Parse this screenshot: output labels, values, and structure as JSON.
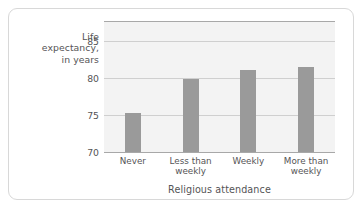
{
  "chart_data": {
    "type": "bar",
    "title": "",
    "xlabel": "Religious attendance",
    "ylabel": "Life expectancy, in years",
    "ylabel_lines": [
      "Life",
      "expectancy,",
      "in years"
    ],
    "categories": [
      "Never",
      "Less than weekly",
      "Weekly",
      "More than weekly"
    ],
    "category_lines": [
      [
        "Never"
      ],
      [
        "Less than",
        "weekly"
      ],
      [
        "Weekly"
      ],
      [
        "More than",
        "weekly"
      ]
    ],
    "values": [
      75.3,
      79.8,
      81.0,
      81.5
    ],
    "ylim": [
      70,
      87.5
    ],
    "yticks": [
      70,
      75,
      80,
      85
    ],
    "ytick_labels": [
      "70",
      "75",
      "80",
      "85"
    ],
    "grid": true,
    "legend": false,
    "colors": {
      "bar": "#9a9a9a",
      "plot_background": "#f3f3f3",
      "gridline": "#cfcfcf",
      "axis_line": "#a8a8a8",
      "text": "#555456",
      "card_border": "#d8d8d8",
      "page_background": "#ffffff"
    }
  }
}
